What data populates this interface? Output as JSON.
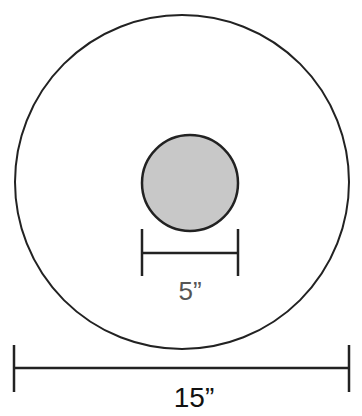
{
  "diagram": {
    "outer_circle": {
      "diameter_label": "15”",
      "fill": "#ffffff",
      "stroke": "#222222"
    },
    "inner_circle": {
      "diameter_label": "5”",
      "fill": "#c8c8c8",
      "stroke": "#222222"
    }
  }
}
